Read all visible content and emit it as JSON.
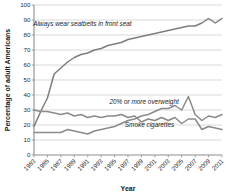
{
  "chart_data": {
    "type": "line",
    "title": "",
    "xlabel": "Year",
    "ylabel": "Percentage of adult Americans",
    "xlim": [
      1983,
      2011
    ],
    "ylim": [
      0,
      100
    ],
    "grid": true,
    "legend_position": "inline-annotations",
    "x": [
      1983,
      1984,
      1985,
      1986,
      1987,
      1988,
      1989,
      1990,
      1991,
      1992,
      1993,
      1994,
      1995,
      1996,
      1997,
      1998,
      1999,
      2000,
      2001,
      2002,
      2003,
      2004,
      2005,
      2006,
      2007,
      2008,
      2009,
      2010,
      2011
    ],
    "y_ticks": [
      0,
      10,
      20,
      30,
      40,
      50,
      60,
      70,
      80,
      90,
      100
    ],
    "x_ticks": [
      1983,
      1985,
      1987,
      1989,
      1991,
      1993,
      1995,
      1997,
      1999,
      2001,
      2003,
      2005,
      2007,
      2009,
      2011
    ],
    "series": [
      {
        "name": "Always wear seatbelts in front seat",
        "color": "#7d7d7d",
        "label_x": 1990.2,
        "label_y": 86,
        "values": [
          19,
          29,
          38,
          54,
          58,
          62,
          65,
          67,
          68,
          70,
          71,
          73,
          74,
          75,
          77,
          78,
          79,
          80,
          81,
          82,
          83,
          84,
          85,
          86,
          86,
          88,
          91,
          88,
          91
        ]
      },
      {
        "name": "20% or more overweight",
        "color": "#8a8a8a",
        "label_x": 1999.4,
        "label_y": 34,
        "values": [
          15,
          15,
          15,
          15,
          15,
          17,
          16,
          15,
          14,
          16,
          17,
          18,
          19,
          21,
          23,
          24,
          26,
          27,
          29,
          31,
          31,
          33,
          30,
          39,
          27,
          23,
          26,
          25,
          27
        ]
      },
      {
        "name": "Smoke cigarettes",
        "color": "#8a8a8a",
        "label_x": 2000.2,
        "label_y": 19,
        "values": [
          30,
          29,
          29,
          28,
          27,
          28,
          26,
          27,
          25,
          26,
          25,
          26,
          26,
          27,
          25,
          26,
          22,
          24,
          23,
          25,
          23,
          25,
          21,
          24,
          24,
          17,
          19,
          18,
          17
        ]
      }
    ]
  },
  "axes": {
    "y_title": "Percentage of adult Americans",
    "x_title": "Year",
    "y_tick_labels": [
      "0",
      "10",
      "20",
      "30",
      "40",
      "50",
      "60",
      "70",
      "80",
      "90",
      "100"
    ],
    "x_tick_labels": [
      "1983",
      "1985",
      "1987",
      "1989",
      "1991",
      "1993",
      "1995",
      "1997",
      "1999",
      "2001",
      "2003",
      "2005",
      "2007",
      "2009",
      "2011"
    ]
  },
  "annotations": {
    "seatbelt": "Always wear seatbelts in front seat",
    "overweight": "20% or more overweight",
    "smoke": "Smoke cigarettes"
  },
  "colors": {
    "line": "#7d7d7d",
    "grid": "#c9c9c9",
    "axis": "#8d8d8d",
    "text": "#1a1a1a"
  }
}
